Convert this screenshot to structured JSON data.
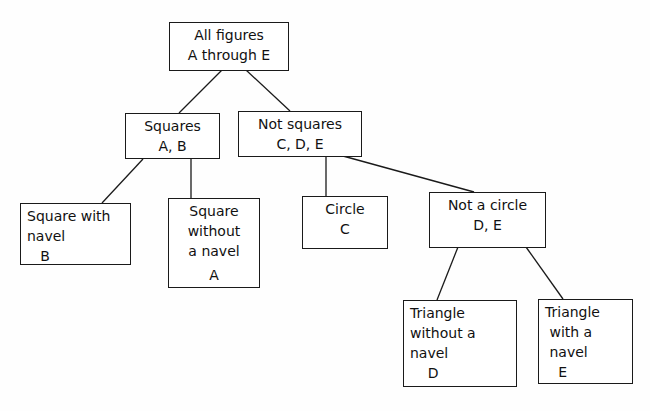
{
  "diagram": {
    "type": "tree",
    "nodes": [
      {
        "id": "root",
        "lines": [
          "All figures",
          "A through E"
        ]
      },
      {
        "id": "squares",
        "lines": [
          "Squares",
          "A, B"
        ]
      },
      {
        "id": "not_squares",
        "lines": [
          "Not squares",
          "C, D, E"
        ]
      },
      {
        "id": "square_with_navel",
        "lines": [
          "Square with",
          "navel",
          "   B"
        ]
      },
      {
        "id": "square_without_navel",
        "lines": [
          "Square",
          "without",
          "a navel",
          "A"
        ]
      },
      {
        "id": "circle",
        "lines": [
          "Circle",
          "C"
        ]
      },
      {
        "id": "not_circle",
        "lines": [
          "Not a circle",
          "D, E"
        ]
      },
      {
        "id": "triangle_without_navel",
        "lines": [
          "Triangle",
          "without a",
          "navel",
          "    D"
        ]
      },
      {
        "id": "triangle_with_navel",
        "lines": [
          "Triangle",
          " with a",
          " navel",
          "   E"
        ]
      }
    ],
    "edges": [
      [
        "root",
        "squares"
      ],
      [
        "root",
        "not_squares"
      ],
      [
        "squares",
        "square_with_navel"
      ],
      [
        "squares",
        "square_without_navel"
      ],
      [
        "not_squares",
        "circle"
      ],
      [
        "not_squares",
        "not_circle"
      ],
      [
        "not_circle",
        "triangle_without_navel"
      ],
      [
        "not_circle",
        "triangle_with_navel"
      ]
    ],
    "colors": {
      "line": "#1a1a1a",
      "background": "#ffffff"
    }
  }
}
